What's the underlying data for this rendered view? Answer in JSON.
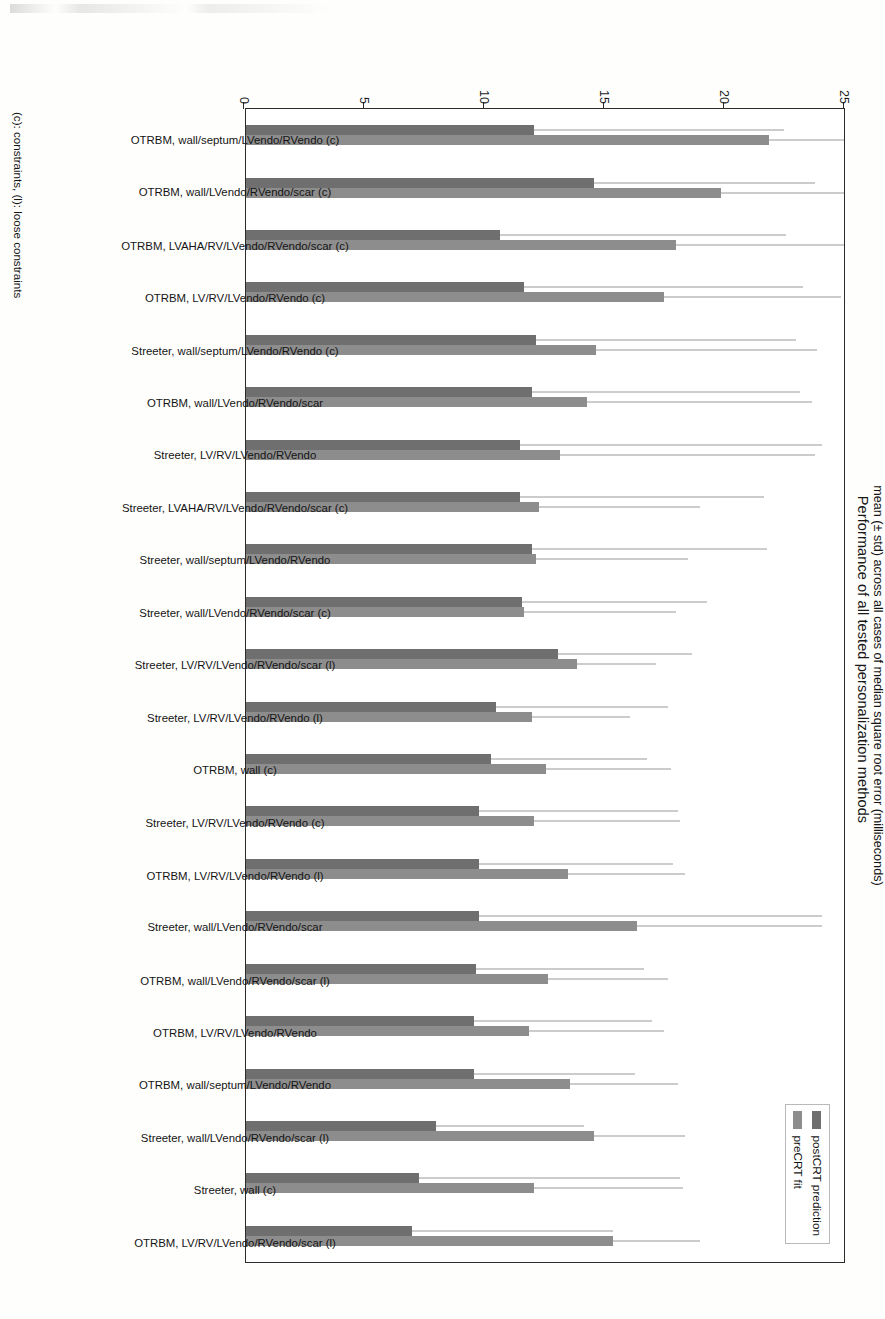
{
  "chart_data": {
    "type": "bar",
    "orientation": "horizontal-rotated",
    "title": "Performance of all tested personalization methods",
    "xlabel": "",
    "ylabel": "mean (± std) across all cases of median square root error (milliseconds)",
    "ylim": [
      0,
      25
    ],
    "yticks": [
      0,
      5,
      10,
      15,
      20,
      25
    ],
    "grid": false,
    "legend_position": "top-right",
    "footnote": "(c): constraints, (l): loose constraints",
    "categories": [
      "OTRBM, wall/septum/LVendo/RVendo (c)",
      "OTRBM, wall/LVendo/RVendo/scar (c)",
      "OTRBM, LVAHA/RV/LVendo/RVendo/scar (c)",
      "OTRBM, LV/RV/LVendo/RVendo (c)",
      "Streeter, wall/septum/LVendo/RVendo (c)",
      "OTRBM, wall/LVendo/RVendo/scar",
      "Streeter, LV/RV/LVendo/RVendo",
      "Streeter, LVAHA/RV/LVendo/RVendo/scar (c)",
      "Streeter, wall/septum/LVendo/RVendo",
      "Streeter, wall/LVendo/RVendo/scar (c)",
      "Streeter, LV/RV/LVendo/RVendo/scar (l)",
      "Streeter, LV/RV/LVendo/RVendo (l)",
      "OTRBM, wall (c)",
      "Streeter, LV/RV/LVendo/RVendo (c)",
      "OTRBM, LV/RV/LVendo/RVendo (l)",
      "Streeter, wall/LVendo/RVendo/scar",
      "OTRBM, wall/LVendo/RVendo/scar (l)",
      "OTRBM, LV/RV/LVendo/RVendo",
      "OTRBM, wall/septum/LVendo/RVendo",
      "Streeter, wall/LVendo/RVendo/scar (l)",
      "Streeter, wall (c)",
      "OTRBM, LV/RV/LVendo/RVendo/scar (l)"
    ],
    "series": [
      {
        "name": "postCRT prediction",
        "color": "#6f6f6f",
        "values": [
          12.0,
          14.5,
          10.6,
          11.6,
          12.1,
          11.9,
          11.4,
          11.4,
          11.9,
          11.5,
          13.0,
          10.4,
          10.2,
          9.7,
          9.7,
          9.7,
          9.6,
          9.5,
          9.5,
          7.9,
          7.2,
          6.9
        ],
        "errors": [
          10.4,
          9.2,
          11.9,
          11.6,
          10.8,
          11.2,
          12.6,
          10.2,
          9.8,
          7.7,
          5.6,
          7.2,
          6.5,
          8.3,
          8.1,
          14.3,
          7.0,
          7.4,
          6.7,
          6.2,
          10.9,
          8.4
        ]
      },
      {
        "name": "preCRT fit",
        "color": "#8d8d8d",
        "values": [
          21.8,
          19.8,
          17.9,
          17.4,
          14.6,
          14.2,
          13.1,
          12.2,
          12.1,
          11.6,
          13.8,
          11.9,
          12.5,
          12.0,
          13.4,
          16.3,
          12.6,
          11.8,
          13.5,
          14.5,
          12.0,
          15.3
        ],
        "errors": [
          3.2,
          5.1,
          7.0,
          7.4,
          9.2,
          9.4,
          10.6,
          6.7,
          6.3,
          6.3,
          3.3,
          4.1,
          5.2,
          6.1,
          4.9,
          7.7,
          5.0,
          5.6,
          4.5,
          3.8,
          6.2,
          3.6
        ]
      }
    ]
  },
  "legend": {
    "items": [
      {
        "label": "postCRT prediction",
        "swatch": "post"
      },
      {
        "label": "preCRT fit",
        "swatch": "pre"
      }
    ]
  }
}
